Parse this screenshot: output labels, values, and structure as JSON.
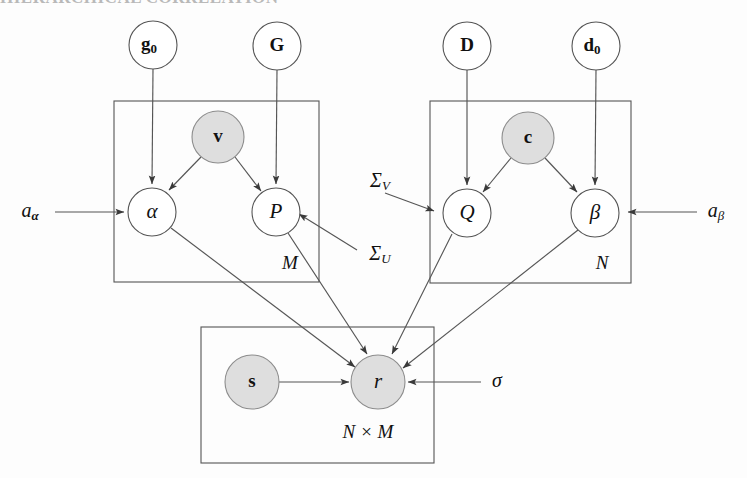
{
  "figure": {
    "title_remnant": "HIERARCHICAL CORRELATION",
    "type": "probabilistic-graphical-model-plate-diagram",
    "background_color": "#ffffff",
    "open_node_fill": "#ffffff",
    "shaded_node_fill": "#dedede",
    "stroke_color": "#555555"
  },
  "nodes": [
    {
      "id": "g0",
      "label": "g",
      "sub": "0",
      "style": "bold",
      "shaded": false,
      "cx": 153,
      "cy": 45,
      "r": 24
    },
    {
      "id": "G",
      "label": "G",
      "sub": "",
      "style": "bold",
      "shaded": false,
      "cx": 277,
      "cy": 46,
      "r": 24
    },
    {
      "id": "D",
      "label": "D",
      "sub": "",
      "style": "bold",
      "shaded": false,
      "cx": 467,
      "cy": 46,
      "r": 24
    },
    {
      "id": "d0",
      "label": "d",
      "sub": "0",
      "style": "bold",
      "shaded": false,
      "cx": 596,
      "cy": 46,
      "r": 24
    },
    {
      "id": "v",
      "label": "v",
      "sub": "",
      "style": "bold",
      "shaded": true,
      "cx": 218,
      "cy": 137,
      "r": 26
    },
    {
      "id": "c",
      "label": "c",
      "sub": "",
      "style": "bold",
      "shaded": true,
      "cx": 528,
      "cy": 138,
      "r": 26
    },
    {
      "id": "alpha",
      "label": "α",
      "sub": "",
      "style": "greek",
      "shaded": false,
      "cx": 152,
      "cy": 212,
      "r": 24
    },
    {
      "id": "P",
      "label": "P",
      "sub": "",
      "style": "italic",
      "shaded": false,
      "cx": 276,
      "cy": 212,
      "r": 24
    },
    {
      "id": "Q",
      "label": "Q",
      "sub": "",
      "style": "italic",
      "shaded": false,
      "cx": 467,
      "cy": 213,
      "r": 24
    },
    {
      "id": "beta",
      "label": "β",
      "sub": "",
      "style": "greek",
      "shaded": false,
      "cx": 595,
      "cy": 213,
      "r": 24
    },
    {
      "id": "s",
      "label": "s",
      "sub": "",
      "style": "bold",
      "shaded": true,
      "cx": 252,
      "cy": 382,
      "r": 27
    },
    {
      "id": "r",
      "label": "r",
      "sub": "",
      "style": "italic",
      "shaded": true,
      "cx": 378,
      "cy": 382,
      "r": 27
    }
  ],
  "plates": [
    {
      "id": "plate-M",
      "label": "M",
      "x": 114,
      "y": 101,
      "w": 205,
      "h": 181,
      "label_x": 290,
      "label_y": 265
    },
    {
      "id": "plate-N",
      "label": "N",
      "x": 430,
      "y": 101,
      "w": 201,
      "h": 182,
      "label_x": 602,
      "label_y": 265
    },
    {
      "id": "plate-NM",
      "label": "N × M",
      "x": 201,
      "y": 327,
      "w": 233,
      "h": 136,
      "label_x": 368,
      "label_y": 434
    }
  ],
  "side_labels": [
    {
      "id": "a-alpha",
      "label": "a",
      "sub": "α",
      "x": 33,
      "y": 212
    },
    {
      "id": "a-beta",
      "label": "a",
      "sub": "β",
      "x": 718,
      "y": 212
    },
    {
      "id": "sigma-V",
      "label": "Σ",
      "sub": "V",
      "x": 382,
      "y": 182
    },
    {
      "id": "sigma-U",
      "label": "Σ",
      "sub": "U",
      "x": 382,
      "y": 255
    },
    {
      "id": "sigma",
      "label": "σ",
      "sub": "",
      "x": 497,
      "y": 382
    }
  ],
  "edges": [
    {
      "from": "g0",
      "to": "alpha",
      "arrow": true
    },
    {
      "from": "G",
      "to": "P",
      "arrow": true
    },
    {
      "from": "v",
      "to": "alpha",
      "arrow": true
    },
    {
      "from": "v",
      "to": "P",
      "arrow": true
    },
    {
      "from": "D",
      "to": "Q",
      "arrow": true
    },
    {
      "from": "d0",
      "to": "beta",
      "arrow": true
    },
    {
      "from": "c",
      "to": "Q",
      "arrow": true
    },
    {
      "from": "c",
      "to": "beta",
      "arrow": true
    },
    {
      "from": "a-alpha",
      "to": "alpha",
      "arrow": true
    },
    {
      "from": "a-beta",
      "to": "beta",
      "arrow": true
    },
    {
      "from": "sigma-U",
      "to": "P",
      "arrow": true
    },
    {
      "from": "sigma-V",
      "to": "Q",
      "arrow": true
    },
    {
      "from": "alpha",
      "to": "r",
      "arrow": true
    },
    {
      "from": "P",
      "to": "r",
      "arrow": true
    },
    {
      "from": "Q",
      "to": "r",
      "arrow": true
    },
    {
      "from": "beta",
      "to": "r",
      "arrow": true
    },
    {
      "from": "s",
      "to": "r",
      "arrow": true
    },
    {
      "from": "sigma",
      "to": "r",
      "arrow": true
    }
  ]
}
